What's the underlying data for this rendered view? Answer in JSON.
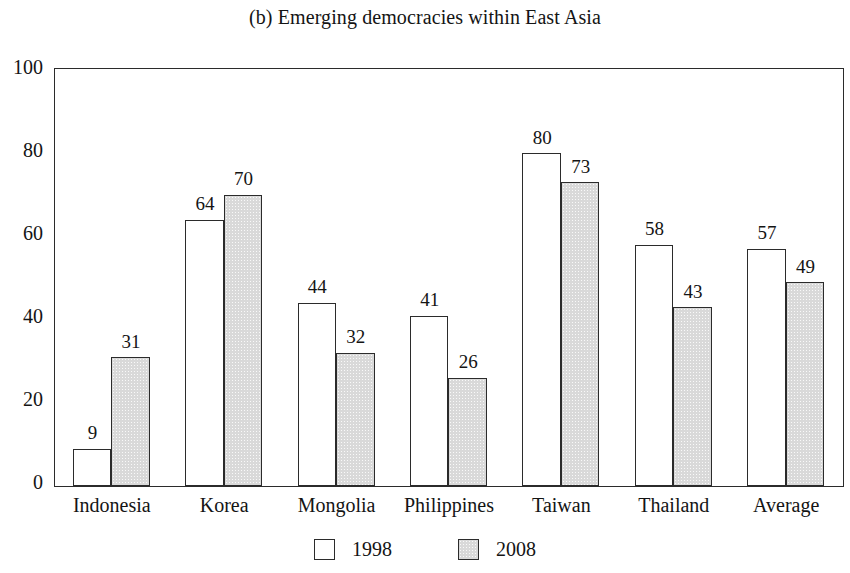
{
  "chart_data": {
    "type": "bar",
    "title": "(b) Emerging democracies within East Asia",
    "xlabel": "",
    "ylabel": "",
    "ylim": [
      0,
      100
    ],
    "yticks": [
      0,
      20,
      40,
      60,
      80,
      100
    ],
    "ytick_labels": [
      "0",
      "20",
      "40",
      "60",
      "80",
      "100"
    ],
    "grid": false,
    "legend_position": "bottom",
    "categories": [
      "Indonesia",
      "Korea",
      "Mongolia",
      "Philippines",
      "Taiwan",
      "Thailand",
      "Average"
    ],
    "series": [
      {
        "name": "1998",
        "color": "#ffffff",
        "values": [
          9,
          64,
          44,
          41,
          80,
          58,
          57
        ]
      },
      {
        "name": "2008",
        "color": "#d9d9d9",
        "values": [
          31,
          70,
          32,
          26,
          73,
          43,
          49
        ]
      }
    ],
    "value_labels": {
      "1998": [
        "9",
        "64",
        "44",
        "41",
        "80",
        "58",
        "57"
      ],
      "2008": [
        "31",
        "70",
        "32",
        "26",
        "73",
        "43",
        "49"
      ]
    }
  },
  "legend": {
    "items": [
      {
        "label": "1998",
        "swatch": "white-square-swatch"
      },
      {
        "label": "2008",
        "swatch": "gray-square-swatch"
      }
    ]
  },
  "colors": {
    "axis": "#2b2b2b",
    "text": "#141414",
    "series_1998_fill": "#ffffff",
    "series_2008_fill": "#d9d9d9",
    "background": "#ffffff"
  }
}
